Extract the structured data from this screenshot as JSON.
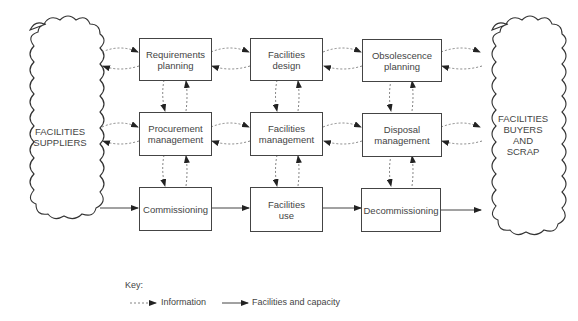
{
  "diagram": {
    "left_cloud": {
      "lines": [
        "FACILITIES",
        "SUPPLIERS"
      ]
    },
    "right_cloud": {
      "lines": [
        "FACILITIES",
        "BUYERS",
        "AND",
        "SCRAP"
      ]
    },
    "boxes": {
      "requirements_planning": [
        "Requirements",
        "planning"
      ],
      "facilities_design": [
        "Facilities",
        "design"
      ],
      "obsolescence_planning": [
        "Obsolescence",
        "planning"
      ],
      "procurement_management": [
        "Procurement",
        "management"
      ],
      "facilities_management": [
        "Facilities",
        "management"
      ],
      "disposal_management": [
        "Disposal",
        "management"
      ],
      "commissioning": [
        "Commissioning"
      ],
      "facilities_use": [
        "Facilities",
        "use"
      ],
      "decommissioning": [
        "Decommissioning"
      ]
    },
    "key": {
      "title": "Key:",
      "information": "Information",
      "facilities_and_capacity": "Facilities and capacity"
    },
    "colors": {
      "line": "#444444",
      "dashed": "#666666",
      "background": "#ffffff"
    }
  }
}
